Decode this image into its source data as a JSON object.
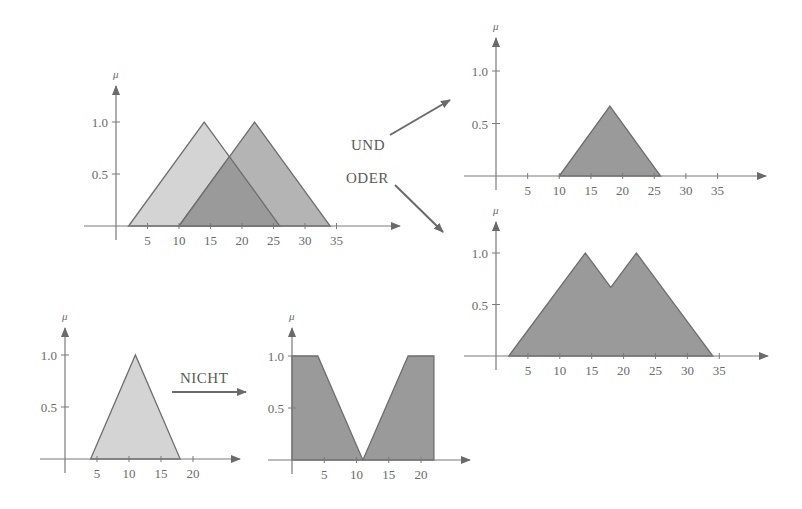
{
  "colors": {
    "axis": "#7a7a7a",
    "light_fill": "#d4d4d4",
    "mid_fill": "#b4b4b4",
    "dark_fill": "#9a9a9a",
    "outline": "#6e6e6e",
    "text": "#6a6a6a"
  },
  "labels": {
    "und": "UND",
    "oder": "ODER",
    "nicht": "NICHT",
    "mu": "μ"
  },
  "chart_data": [
    {
      "id": "input-sets",
      "type": "area",
      "title": "",
      "ylabel": "μ",
      "xlabel": "",
      "x_ticks": [
        5,
        10,
        15,
        20,
        25,
        30,
        35
      ],
      "y_ticks": [
        0.5,
        1.0
      ],
      "ylim": [
        0,
        1.0
      ],
      "series": [
        {
          "name": "A",
          "fill": "light",
          "points": [
            [
              2,
              0
            ],
            [
              14,
              1.0
            ],
            [
              26,
              0
            ]
          ]
        },
        {
          "name": "B",
          "fill": "mid",
          "points": [
            [
              10,
              0
            ],
            [
              22,
              1.0
            ],
            [
              34,
              0
            ]
          ]
        },
        {
          "name": "A∩B overlap",
          "fill": "dark",
          "points": [
            [
              10,
              0
            ],
            [
              18,
              0.667
            ],
            [
              26,
              0
            ]
          ]
        }
      ],
      "frame": {
        "ox": 116,
        "oy": 226,
        "sx": 6.3,
        "sy": 104,
        "xmin_px": 84,
        "xmax_px": 400,
        "ytop_px": 86
      }
    },
    {
      "id": "und-result",
      "type": "area",
      "title": "UND",
      "ylabel": "μ",
      "x_ticks": [
        5,
        10,
        15,
        20,
        25,
        30,
        35
      ],
      "y_ticks": [
        0.5,
        1.0
      ],
      "ylim": [
        0,
        1.0
      ],
      "series": [
        {
          "name": "min(A,B)",
          "fill": "dark",
          "points": [
            [
              10,
              0
            ],
            [
              18,
              0.667
            ],
            [
              26,
              0
            ]
          ]
        }
      ],
      "frame": {
        "ox": 496,
        "oy": 176,
        "sx": 6.33,
        "sy": 105,
        "xmin_px": 464,
        "xmax_px": 766,
        "ytop_px": 38
      }
    },
    {
      "id": "oder-result",
      "type": "area",
      "title": "ODER",
      "ylabel": "μ",
      "x_ticks": [
        5,
        10,
        15,
        20,
        25,
        30,
        35
      ],
      "y_ticks": [
        0.5,
        1.0
      ],
      "ylim": [
        0,
        1.0
      ],
      "series": [
        {
          "name": "max(A,B)",
          "fill": "dark",
          "points": [
            [
              2,
              0
            ],
            [
              14,
              1.0
            ],
            [
              18,
              0.667
            ],
            [
              22,
              1.0
            ],
            [
              34,
              0
            ]
          ]
        }
      ],
      "frame": {
        "ox": 496,
        "oy": 356,
        "sx": 6.38,
        "sy": 103,
        "xmin_px": 464,
        "xmax_px": 768,
        "ytop_px": 222
      }
    },
    {
      "id": "nicht-input",
      "type": "area",
      "title": "",
      "ylabel": "μ",
      "x_ticks": [
        5,
        10,
        15,
        20
      ],
      "y_ticks": [
        0.5,
        1.0
      ],
      "ylim": [
        0,
        1.0
      ],
      "series": [
        {
          "name": "C",
          "fill": "light",
          "points": [
            [
              4,
              0
            ],
            [
              11,
              1.0
            ],
            [
              18,
              0
            ]
          ]
        }
      ],
      "frame": {
        "ox": 65,
        "oy": 459,
        "sx": 6.4,
        "sy": 104,
        "xmin_px": 40,
        "xmax_px": 240,
        "ytop_px": 328
      }
    },
    {
      "id": "nicht-result",
      "type": "area",
      "title": "NICHT",
      "ylabel": "μ",
      "x_ticks": [
        5,
        10,
        15,
        20
      ],
      "y_ticks": [
        0.5,
        1.0
      ],
      "ylim": [
        0,
        1.0
      ],
      "series": [
        {
          "name": "1 - C (left)",
          "fill": "dark",
          "points": [
            [
              0,
              0
            ],
            [
              0,
              1.0
            ],
            [
              4,
              1.0
            ],
            [
              11,
              0
            ]
          ]
        },
        {
          "name": "1 - C (right)",
          "fill": "dark",
          "points": [
            [
              11,
              0
            ],
            [
              18,
              1.0
            ],
            [
              22,
              1.0
            ],
            [
              22,
              0
            ]
          ]
        }
      ],
      "frame": {
        "ox": 292,
        "oy": 460,
        "sx": 6.45,
        "sy": 104,
        "xmin_px": 268,
        "xmax_px": 470,
        "ytop_px": 328
      }
    }
  ],
  "operator_arrows": [
    {
      "name": "und-arrow",
      "x1": 390,
      "y1": 135,
      "x2": 450,
      "y2": 100
    },
    {
      "name": "oder-arrow",
      "x1": 395,
      "y1": 185,
      "x2": 443,
      "y2": 232
    },
    {
      "name": "nicht-arrow",
      "x1": 172,
      "y1": 392,
      "x2": 246,
      "y2": 392
    }
  ]
}
